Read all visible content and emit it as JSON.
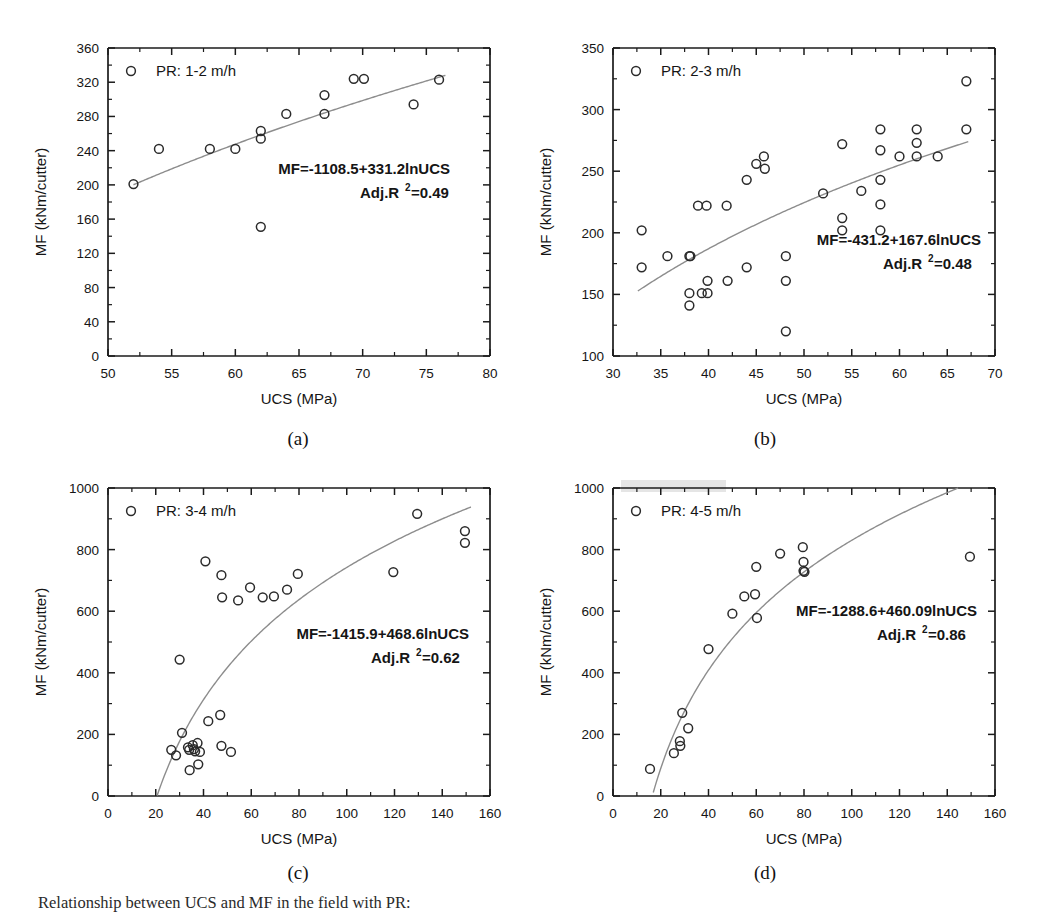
{
  "figure": {
    "caption": "Relationship between UCS and MF in the field with PR:"
  },
  "panels": [
    {
      "id": "a",
      "caption": "(a)",
      "legend": "PR: 1-2 m/h",
      "equation": "MF=-1108.5+331.2lnUCS",
      "r2_prefix": "Adj.R",
      "r2_sup": "2",
      "r2_value": "=0.49",
      "xlabel": "UCS (MPa)",
      "ylabel": "MF (kNm/cutter)"
    },
    {
      "id": "b",
      "caption": "(b)",
      "legend": "PR: 2-3 m/h",
      "equation": "MF=-431.2+167.6lnUCS",
      "r2_prefix": "Adj.R",
      "r2_sup": "2",
      "r2_value": "=0.48",
      "xlabel": "UCS (MPa)",
      "ylabel": "MF (kNm/cutter)"
    },
    {
      "id": "c",
      "caption": "(c)",
      "legend": "PR: 3-4 m/h",
      "equation": "MF=-1415.9+468.6lnUCS",
      "r2_prefix": "Adj.R",
      "r2_sup": "2",
      "r2_value": "=0.62",
      "xlabel": "UCS (MPa)",
      "ylabel": "MF (kNm/cutter)"
    },
    {
      "id": "d",
      "caption": "(d)",
      "legend": "PR: 4-5 m/h",
      "equation": "MF=-1288.6+460.09lnUCS",
      "r2_prefix": "Adj.R",
      "r2_sup": "2",
      "r2_value": "=0.86",
      "xlabel": "UCS (MPa)",
      "ylabel": "MF (kNm/cutter)"
    }
  ],
  "chart_data": [
    {
      "panel": "a",
      "type": "scatter",
      "title": "",
      "xlabel": "UCS (MPa)",
      "ylabel": "MF (kNm/cutter)",
      "xlim": [
        50,
        80
      ],
      "ylim": [
        0,
        360
      ],
      "xticks": [
        50,
        55,
        60,
        65,
        70,
        75,
        80
      ],
      "yticks": [
        0,
        40,
        80,
        120,
        160,
        200,
        240,
        280,
        320,
        360
      ],
      "grid": false,
      "legend": "PR: 1-2 m/h",
      "legend_position": "top-left",
      "annotation": "MF=-1108.5+331.2lnUCS / Adj.R2=0.49",
      "fit": {
        "kind": "logarithmic",
        "intercept": -1108.5,
        "slope": 331.2,
        "adj_r2": 0.49
      },
      "points": [
        {
          "x": 52.0,
          "y": 201
        },
        {
          "x": 54.0,
          "y": 242
        },
        {
          "x": 58.0,
          "y": 242
        },
        {
          "x": 60.0,
          "y": 242
        },
        {
          "x": 62.0,
          "y": 263
        },
        {
          "x": 62.0,
          "y": 254
        },
        {
          "x": 62.0,
          "y": 151
        },
        {
          "x": 64.0,
          "y": 283
        },
        {
          "x": 67.0,
          "y": 305
        },
        {
          "x": 67.0,
          "y": 283
        },
        {
          "x": 69.3,
          "y": 324
        },
        {
          "x": 70.1,
          "y": 324
        },
        {
          "x": 74.0,
          "y": 294
        },
        {
          "x": 76.0,
          "y": 323
        }
      ]
    },
    {
      "panel": "b",
      "type": "scatter",
      "title": "",
      "xlabel": "UCS (MPa)",
      "ylabel": "MF (kNm/cutter)",
      "xlim": [
        30,
        70
      ],
      "ylim": [
        100,
        350
      ],
      "xticks": [
        30,
        35,
        40,
        45,
        50,
        55,
        60,
        65,
        70
      ],
      "yticks": [
        100,
        150,
        200,
        250,
        300,
        350
      ],
      "grid": false,
      "legend": "PR: 2-3 m/h",
      "legend_position": "top-left",
      "annotation": "MF=-431.2+167.6lnUCS / Adj.R2=0.48",
      "fit": {
        "kind": "logarithmic",
        "intercept": -431.2,
        "slope": 167.6,
        "adj_r2": 0.48
      },
      "points": [
        {
          "x": 33.0,
          "y": 202
        },
        {
          "x": 33.0,
          "y": 172
        },
        {
          "x": 35.7,
          "y": 181
        },
        {
          "x": 38.0,
          "y": 181
        },
        {
          "x": 38.1,
          "y": 181
        },
        {
          "x": 38.0,
          "y": 151
        },
        {
          "x": 38.0,
          "y": 141
        },
        {
          "x": 38.9,
          "y": 222
        },
        {
          "x": 39.3,
          "y": 151
        },
        {
          "x": 39.9,
          "y": 151
        },
        {
          "x": 39.8,
          "y": 222
        },
        {
          "x": 39.9,
          "y": 161
        },
        {
          "x": 41.9,
          "y": 222
        },
        {
          "x": 42.0,
          "y": 161
        },
        {
          "x": 44.0,
          "y": 243
        },
        {
          "x": 44.0,
          "y": 172
        },
        {
          "x": 45.0,
          "y": 256
        },
        {
          "x": 45.8,
          "y": 262
        },
        {
          "x": 45.9,
          "y": 252
        },
        {
          "x": 48.1,
          "y": 181
        },
        {
          "x": 48.1,
          "y": 161
        },
        {
          "x": 48.1,
          "y": 120
        },
        {
          "x": 52.0,
          "y": 232
        },
        {
          "x": 54.0,
          "y": 272
        },
        {
          "x": 54.0,
          "y": 212
        },
        {
          "x": 54.0,
          "y": 202
        },
        {
          "x": 56.0,
          "y": 234
        },
        {
          "x": 58.0,
          "y": 284
        },
        {
          "x": 58.0,
          "y": 267
        },
        {
          "x": 58.0,
          "y": 243
        },
        {
          "x": 58.0,
          "y": 223
        },
        {
          "x": 58.0,
          "y": 202
        },
        {
          "x": 60.0,
          "y": 262
        },
        {
          "x": 61.8,
          "y": 284
        },
        {
          "x": 61.8,
          "y": 273
        },
        {
          "x": 61.8,
          "y": 262
        },
        {
          "x": 64.0,
          "y": 262
        },
        {
          "x": 67.0,
          "y": 323
        },
        {
          "x": 67.0,
          "y": 284
        }
      ]
    },
    {
      "panel": "c",
      "type": "scatter",
      "title": "",
      "xlabel": "UCS (MPa)",
      "ylabel": "MF (kNm/cutter)",
      "xlim": [
        0,
        160
      ],
      "ylim": [
        0,
        1000
      ],
      "xticks": [
        0,
        20,
        40,
        60,
        80,
        100,
        120,
        140,
        160
      ],
      "yticks": [
        0,
        200,
        400,
        600,
        800,
        1000
      ],
      "grid": false,
      "legend": "PR: 3-4 m/h",
      "legend_position": "top-left",
      "annotation": "MF=-1415.9+468.6lnUCS / Adj.R2=0.62",
      "fit": {
        "kind": "logarithmic",
        "intercept": -1415.9,
        "slope": 468.6,
        "adj_r2": 0.62
      },
      "points": [
        {
          "x": 26.5,
          "y": 150
        },
        {
          "x": 28.5,
          "y": 132
        },
        {
          "x": 30.0,
          "y": 443
        },
        {
          "x": 31.0,
          "y": 205
        },
        {
          "x": 33.5,
          "y": 158
        },
        {
          "x": 34.0,
          "y": 150
        },
        {
          "x": 34.2,
          "y": 84
        },
        {
          "x": 35.5,
          "y": 165
        },
        {
          "x": 36.0,
          "y": 152
        },
        {
          "x": 36.5,
          "y": 145
        },
        {
          "x": 37.5,
          "y": 172
        },
        {
          "x": 37.8,
          "y": 103
        },
        {
          "x": 38.5,
          "y": 143
        },
        {
          "x": 40.8,
          "y": 762
        },
        {
          "x": 42.0,
          "y": 243
        },
        {
          "x": 47.0,
          "y": 263
        },
        {
          "x": 47.5,
          "y": 717
        },
        {
          "x": 47.8,
          "y": 645
        },
        {
          "x": 47.5,
          "y": 163
        },
        {
          "x": 51.5,
          "y": 143
        },
        {
          "x": 54.5,
          "y": 635
        },
        {
          "x": 59.5,
          "y": 677
        },
        {
          "x": 64.8,
          "y": 645
        },
        {
          "x": 69.5,
          "y": 648
        },
        {
          "x": 75.0,
          "y": 670
        },
        {
          "x": 79.5,
          "y": 721
        },
        {
          "x": 119.5,
          "y": 727
        },
        {
          "x": 129.5,
          "y": 916
        },
        {
          "x": 149.5,
          "y": 860
        },
        {
          "x": 149.5,
          "y": 822
        }
      ]
    },
    {
      "panel": "d",
      "type": "scatter",
      "title": "",
      "xlabel": "UCS (MPa)",
      "ylabel": "MF (kNm/cutter)",
      "xlim": [
        0,
        160
      ],
      "ylim": [
        0,
        1000
      ],
      "xticks": [
        0,
        20,
        40,
        60,
        80,
        100,
        120,
        140,
        160
      ],
      "yticks": [
        0,
        200,
        400,
        600,
        800,
        1000
      ],
      "grid": false,
      "legend": "PR: 4-5 m/h",
      "legend_position": "top-left",
      "annotation": "MF=-1288.6+460.09lnUCS / Adj.R2=0.86",
      "fit": {
        "kind": "logarithmic",
        "intercept": -1288.6,
        "slope": 460.09,
        "adj_r2": 0.86
      },
      "points": [
        {
          "x": 15.5,
          "y": 88
        },
        {
          "x": 25.5,
          "y": 139
        },
        {
          "x": 28.0,
          "y": 178
        },
        {
          "x": 28.2,
          "y": 163
        },
        {
          "x": 29.0,
          "y": 270
        },
        {
          "x": 31.5,
          "y": 220
        },
        {
          "x": 40.0,
          "y": 477
        },
        {
          "x": 50.0,
          "y": 592
        },
        {
          "x": 55.0,
          "y": 648
        },
        {
          "x": 59.5,
          "y": 655
        },
        {
          "x": 60.0,
          "y": 744
        },
        {
          "x": 60.3,
          "y": 578
        },
        {
          "x": 70.0,
          "y": 787
        },
        {
          "x": 79.5,
          "y": 808
        },
        {
          "x": 79.8,
          "y": 760
        },
        {
          "x": 79.8,
          "y": 731
        },
        {
          "x": 80.2,
          "y": 728
        },
        {
          "x": 149.5,
          "y": 777
        }
      ]
    }
  ]
}
